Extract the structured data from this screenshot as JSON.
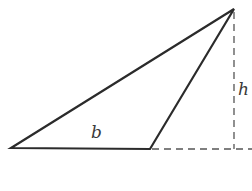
{
  "diagram": {
    "type": "geometry",
    "labels": {
      "base": "b",
      "height": "h"
    },
    "colors": {
      "stroke": "#2b2b2b",
      "dashed": "#555555",
      "background": "#ffffff"
    },
    "vertices": {
      "left": [
        11,
        148
      ],
      "base_right": [
        150,
        149
      ],
      "apex": [
        234,
        9
      ]
    },
    "dashed_lines": {
      "height_foot": [
        234,
        149
      ],
      "base_extension_end": [
        252,
        149
      ]
    }
  }
}
